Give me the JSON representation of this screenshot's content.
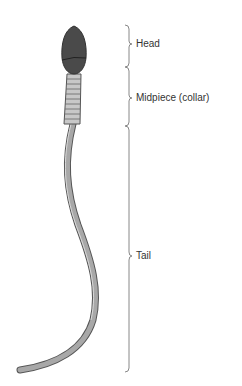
{
  "diagram": {
    "labels": [
      {
        "id": "head",
        "text": "Head"
      },
      {
        "id": "midpiece",
        "text": "Midpiece (collar)"
      },
      {
        "id": "tail",
        "text": "Tail"
      }
    ],
    "colors": {
      "head": "#4a4a4a",
      "midpiece": "#c8c8c8",
      "tail": "#9a9a9a",
      "outline": "#555555",
      "brace": "#888888",
      "text": "#333333"
    }
  }
}
